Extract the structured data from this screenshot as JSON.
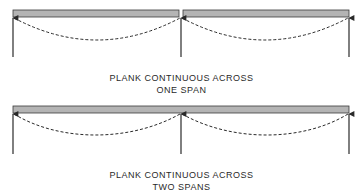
{
  "diagrams": [
    {
      "id": "one-span",
      "caption_line1": "PLANK CONTINUOUS ACROSS",
      "caption_line2": "ONE SPAN",
      "plank_segments": 2,
      "supports": 3
    },
    {
      "id": "two-spans",
      "caption_line1": "PLANK CONTINUOUS ACROSS",
      "caption_line2": "TWO SPANS",
      "plank_segments": 1,
      "supports": 3
    }
  ],
  "colors": {
    "plank_fill": "#b4b4b4",
    "plank_stroke": "#3a3a3a",
    "line": "#2a2a2a"
  }
}
